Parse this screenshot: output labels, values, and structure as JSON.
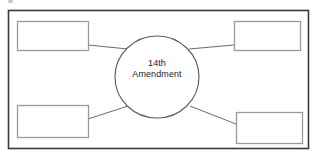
{
  "document": {
    "type": "graphic-organizer-worksheet",
    "background_color": "#ffffff"
  },
  "frame": {
    "name": "outer-border",
    "stroke_color": "#3a3a3a",
    "x": 8,
    "y": 10,
    "width": 300,
    "height": 138
  },
  "center_node": {
    "shape": "ellipse",
    "label_line1": "14th",
    "label_line2": "Amendment",
    "stroke_color": "#5a5a5a",
    "cx": 157,
    "cy": 77,
    "rx": 42,
    "ry": 41
  },
  "boxes": [
    {
      "id": "box-top-left",
      "label": "",
      "stroke_color": "#9a9a9a",
      "x": 17,
      "y": 21,
      "width": 71,
      "height": 29
    },
    {
      "id": "box-top-right",
      "label": "",
      "stroke_color": "#9a9a9a",
      "x": 234,
      "y": 21,
      "width": 66,
      "height": 29
    },
    {
      "id": "box-bottom-left",
      "label": "",
      "stroke_color": "#9a9a9a",
      "x": 17,
      "y": 105,
      "width": 71,
      "height": 32
    },
    {
      "id": "box-bottom-right",
      "label": "",
      "stroke_color": "#9a9a9a",
      "x": 236,
      "y": 112,
      "width": 66,
      "height": 31
    }
  ],
  "connectors": [
    {
      "id": "connector-top-left",
      "from": "box-top-left",
      "to": "center_node",
      "x1": 88,
      "y1": 45,
      "x2": 128,
      "y2": 49,
      "stroke_color": "#6b6b6b"
    },
    {
      "id": "connector-top-right",
      "from": "box-top-right",
      "to": "center_node",
      "x1": 234,
      "y1": 45,
      "x2": 189,
      "y2": 49,
      "stroke_color": "#6b6b6b"
    },
    {
      "id": "connector-bottom-left",
      "from": "box-bottom-left",
      "to": "center_node",
      "x1": 88,
      "y1": 119,
      "x2": 128,
      "y2": 106,
      "stroke_color": "#6b6b6b"
    },
    {
      "id": "connector-bottom-right",
      "from": "box-bottom-right",
      "to": "center_node",
      "x1": 236,
      "y1": 124,
      "x2": 190,
      "y2": 106,
      "stroke_color": "#6b6b6b"
    }
  ],
  "artifacts": {
    "scan_speck_present": true
  }
}
